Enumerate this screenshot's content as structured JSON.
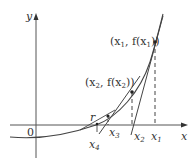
{
  "diagram": {
    "axes": {
      "x_label": "x",
      "y_label": "y",
      "origin_label": "0"
    },
    "points": [
      {
        "id": "p1",
        "label_pre": "(x",
        "label_sub": "1",
        "label_mid": ", f(x",
        "label_sub2": "1",
        "label_post": "))"
      },
      {
        "id": "p2",
        "label_pre": "(x",
        "label_sub": "2",
        "label_mid": ", f(x",
        "label_sub2": "2",
        "label_post": "))"
      }
    ],
    "axis_marks": [
      {
        "id": "x1",
        "base": "x",
        "sub": "1"
      },
      {
        "id": "x2",
        "base": "x",
        "sub": "2"
      },
      {
        "id": "x3",
        "base": "x",
        "sub": "3"
      },
      {
        "id": "x4",
        "base": "x",
        "sub": "4"
      },
      {
        "id": "r",
        "base": "r",
        "sub": ""
      }
    ],
    "colors": {
      "curve": "#444444",
      "axes": "#555555",
      "text": "#333333"
    }
  }
}
